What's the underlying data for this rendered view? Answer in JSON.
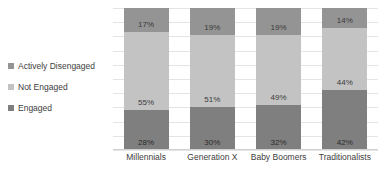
{
  "chart_data": {
    "type": "bar",
    "stacked": true,
    "stack_mode": "percent",
    "title": "",
    "subtitle": "",
    "xlabel": "",
    "ylabel": "",
    "ylim": [
      0,
      100
    ],
    "grid": true,
    "legend_position": "left",
    "categories": [
      "Millennials",
      "Generation X",
      "Baby Boomers",
      "Traditionalists"
    ],
    "series": [
      {
        "name": "Engaged",
        "color": "#7f7f7f",
        "values": [
          28,
          30,
          32,
          42
        ],
        "labels": [
          "28%",
          "30%",
          "32%",
          "42%"
        ]
      },
      {
        "name": "Not Engaged",
        "color": "#c3c3c3",
        "values": [
          55,
          51,
          49,
          44
        ],
        "labels": [
          "55%",
          "51%",
          "49%",
          "44%"
        ]
      },
      {
        "name": "Actively Disengaged",
        "color": "#949494",
        "values": [
          17,
          19,
          19,
          14
        ],
        "labels": [
          "17%",
          "19%",
          "19%",
          "14%"
        ]
      }
    ],
    "stack_order_bottom_to_top": [
      "Engaged",
      "Not Engaged",
      "Actively Disengaged"
    ],
    "gridline_values": [
      0,
      10,
      20,
      30,
      40,
      50,
      60,
      70,
      80,
      90,
      100
    ],
    "axis_tick_labels_visible": false
  },
  "legend": {
    "items": [
      {
        "label": "Actively Disengaged",
        "color": "#949494"
      },
      {
        "label": "Not Engaged",
        "color": "#c3c3c3"
      },
      {
        "label": "Engaged",
        "color": "#7f7f7f"
      }
    ]
  },
  "colors": {
    "engaged": "#7f7f7f",
    "not_engaged": "#c3c3c3",
    "actively_disengaged": "#949494",
    "gridline": "#e4e4e4",
    "text": "#404040",
    "background": "#ffffff"
  }
}
